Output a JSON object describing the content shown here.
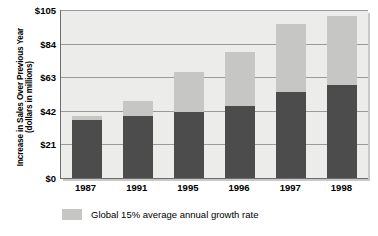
{
  "chart_data": {
    "type": "bar",
    "stacked": true,
    "title": "",
    "xlabel": "",
    "ylabel": "Increase in Sales Over Previous Year (dollars in millions)",
    "ylabel_lines": [
      "Increase in Sales Over Previous Year",
      "(dollars in millions)"
    ],
    "categories": [
      "1987",
      "1991",
      "1995",
      "1996",
      "1997",
      "1998"
    ],
    "ylim": [
      0,
      105
    ],
    "yticks": [
      0,
      21,
      42,
      63,
      84,
      105
    ],
    "ytick_labels": [
      "$0",
      "$21",
      "$42",
      "$63",
      "$84",
      "$105"
    ],
    "grid": true,
    "legend_position": "below",
    "series": [
      {
        "name": "Actual increase in sales",
        "color": "#4c4c4c",
        "values": [
          36,
          39,
          41,
          45,
          54,
          58
        ]
      },
      {
        "name": "Global 15% average annual growth rate",
        "color": "#c6c6c4",
        "values": [
          39,
          48,
          66,
          79,
          96,
          101
        ]
      }
    ],
    "legend": [
      {
        "label": "Global 15% average annual growth rate",
        "color": "#c6c6c4"
      }
    ]
  },
  "colors": {
    "plot_background": "#ececeb",
    "gridline": "#9a9a9a",
    "axis": "#6e6e6e",
    "bar_dark": "#4c4c4c",
    "bar_light": "#c6c6c4",
    "text": "#000000",
    "page_background": "#ffffff"
  }
}
